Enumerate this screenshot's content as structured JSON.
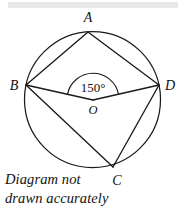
{
  "figure": {
    "type": "geometry-diagram",
    "shape": "circle-with-cyclic-quadrilateral",
    "circle": {
      "center_label": "O",
      "cx": 92.5,
      "cy": 99.5,
      "r": 68
    },
    "vertices": [
      {
        "id": "A",
        "label": "A",
        "x": 88,
        "y": 32,
        "label_x": 88,
        "label_y": 22
      },
      {
        "id": "B",
        "label": "B",
        "x": 26,
        "y": 85,
        "label_x": 14,
        "label_y": 90
      },
      {
        "id": "D",
        "label": "D",
        "x": 159,
        "y": 85,
        "label_x": 169,
        "label_y": 90
      },
      {
        "id": "C",
        "label": "C",
        "x": 113,
        "y": 167,
        "label_x": 116,
        "label_y": 184
      }
    ],
    "center_point": {
      "label": "O",
      "x": 93,
      "y": 100,
      "label_x": 93,
      "label_y": 114
    },
    "segments": [
      {
        "from": "A",
        "to": "B"
      },
      {
        "from": "A",
        "to": "D"
      },
      {
        "from": "B",
        "to": "O"
      },
      {
        "from": "O",
        "to": "D"
      },
      {
        "from": "B",
        "to": "C"
      },
      {
        "from": "D",
        "to": "C"
      }
    ],
    "angle": {
      "name": "angle-BOD",
      "vertex": "O",
      "value": "150",
      "unit": "°",
      "label": "150°",
      "label_x": 93,
      "label_y": 92,
      "arc_radius": 26
    }
  },
  "caption": {
    "line1": "Diagram not",
    "line2": "drawn accurately"
  },
  "colors": {
    "ink": "#1a1a1a",
    "paper": "#ffffff",
    "band": "#e8e8e8"
  }
}
